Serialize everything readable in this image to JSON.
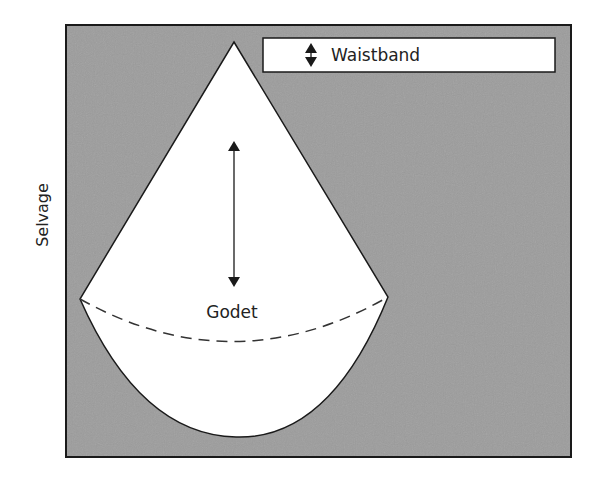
{
  "diagram": {
    "selvage_label": "Selvage",
    "waistband_label": "Waistband",
    "godet_label": "Godet",
    "colors": {
      "fabric": "#9c9c9c",
      "piece": "#ffffff",
      "line": "#1a1a1a"
    }
  }
}
